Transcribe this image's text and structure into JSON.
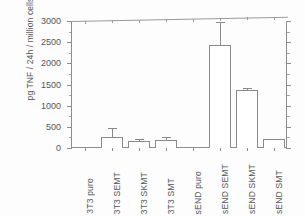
{
  "chart_data": {
    "type": "bar",
    "title": "",
    "xlabel": "",
    "ylabel": "pg TNF / 24h / million cells",
    "ylim": [
      0,
      3000
    ],
    "ytick_labels": [
      "0",
      "500",
      "1000",
      "1500",
      "2000",
      "2500",
      "3000"
    ],
    "ytick_values": [
      0,
      500,
      1000,
      1500,
      2000,
      2500,
      3000
    ],
    "grid": false,
    "legend": "none",
    "categories": [
      "3T3 puro",
      "3T3 SEMT",
      "3T3 SKMT",
      "3T3 SMT",
      "sEND puro",
      "sEND SEMT",
      "sEND SKMT",
      "sEND SMT"
    ],
    "values": [
      0,
      260,
      175,
      190,
      0,
      2440,
      1375,
      210
    ],
    "errors": [
      0,
      210,
      40,
      70,
      0,
      535,
      40,
      0
    ],
    "series": [
      {
        "name": "TNF secretion",
        "values": [
          0,
          260,
          175,
          190,
          0,
          2440,
          1375,
          210
        ],
        "errors": [
          0,
          210,
          40,
          70,
          0,
          535,
          40,
          0
        ]
      }
    ],
    "colors": {
      "bar_fill": "#ffffff",
      "bar_edge": "#8a8a8a",
      "axis": "#8d8d8d",
      "text": "#555555",
      "background": "#fdfdfd"
    }
  }
}
